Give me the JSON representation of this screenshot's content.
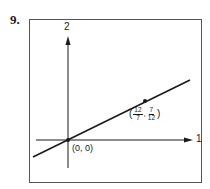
{
  "problem": {
    "number": "9."
  },
  "axes": {
    "vertical_label": "2",
    "horizontal_label": "1"
  },
  "points": [
    {
      "name": "origin",
      "label": "(0, 0)"
    },
    {
      "name": "point-a",
      "label_open": "(",
      "x_num": "12",
      "x_den": "7",
      "separator": ",",
      "y_num": "7",
      "y_den": "12",
      "label_close": ")"
    }
  ],
  "colors": {
    "ink": "#1a1a1a",
    "frame": "#555555",
    "background": "#ffffff"
  }
}
